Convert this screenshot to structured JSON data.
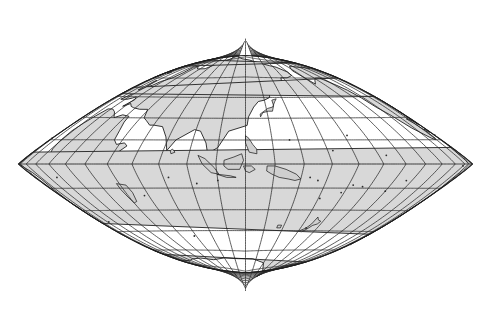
{
  "figure": {
    "kind": "world-map",
    "background_color": "#ffffff",
    "line_color": "#1c1c1c",
    "land_fill_color": "#d8d8d8",
    "coast_color": "#141414"
  },
  "projection": {
    "name": "bow-tie epicycloidal",
    "central_meridian_deg": 120,
    "equator_straight": true,
    "poles_are_points": true,
    "north_pole_cusp": {
      "x": 245,
      "y": 42
    },
    "south_pole_cusp": {
      "x": 248,
      "y": 290
    },
    "bounds": {
      "left": 18,
      "right": 472,
      "top": 22,
      "bottom": 306
    }
  },
  "graticule": {
    "meridian_interval_deg": 15,
    "parallel_interval_deg": 15,
    "meridians_deg": [
      -180,
      -165,
      -150,
      -135,
      -120,
      -105,
      -90,
      -75,
      -60,
      -45,
      -30,
      -15,
      0,
      15,
      30,
      45,
      60,
      75,
      90,
      105,
      120,
      135,
      150,
      165,
      180
    ],
    "parallels_deg": [
      -75,
      -60,
      -45,
      -30,
      -15,
      0,
      15,
      30,
      45,
      60,
      75
    ],
    "equator_label": "0",
    "grid_visible": true
  },
  "landmasses": [
    {
      "name": "Eurasia",
      "visible": true
    },
    {
      "name": "Africa",
      "visible": true
    },
    {
      "name": "Australia",
      "visible": true
    },
    {
      "name": "North America",
      "visible": true
    },
    {
      "name": "South America",
      "visible": true
    },
    {
      "name": "Antarctica",
      "visible": true
    },
    {
      "name": "Greenland",
      "visible": true
    },
    {
      "name": "New Guinea",
      "visible": true
    },
    {
      "name": "New Zealand",
      "visible": true
    },
    {
      "name": "Madagascar",
      "visible": true
    },
    {
      "name": "Japan",
      "visible": true
    },
    {
      "name": "Indonesia",
      "visible": true
    },
    {
      "name": "Philippines",
      "visible": true
    },
    {
      "name": "British Isles",
      "visible": true
    },
    {
      "name": "Borneo",
      "visible": true
    }
  ]
}
